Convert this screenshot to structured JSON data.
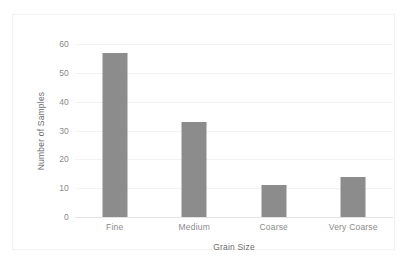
{
  "chart_data": {
    "type": "bar",
    "title": "",
    "subtitle": "",
    "categories": [
      "Fine",
      "Medium",
      "Coarse",
      "Very Coarse"
    ],
    "values": [
      57,
      33,
      11,
      14
    ],
    "xlabel": "Grain Size",
    "ylabel": "Number of Samples",
    "ylim": [
      0,
      60
    ],
    "yticks": [
      0,
      10,
      20,
      30,
      40,
      50,
      60
    ],
    "ytick_labels": [
      "0",
      "10",
      "20",
      "30",
      "40",
      "50",
      "60"
    ],
    "grid": "horizontal",
    "legend": "none",
    "annotations": [],
    "series": [
      {
        "name": "Number of Samples",
        "values": [
          57,
          33,
          11,
          14
        ]
      }
    ]
  },
  "style": {
    "bar_color": "#8c8c8c",
    "gridline_color": "#f2f2f2",
    "axis_line_color": "#e3e3e3",
    "tick_label_color": "#8a8a8a",
    "axis_title_color": "#6e6e6e",
    "frame_border_color": "#f0f0f0",
    "background_color": "#ffffff"
  }
}
